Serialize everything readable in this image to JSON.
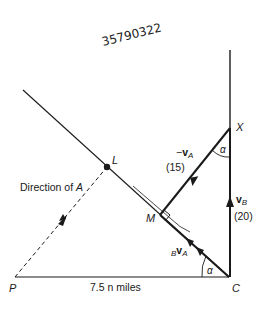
{
  "handwritten_note": "35790322",
  "points": {
    "P": {
      "label": "P"
    },
    "C": {
      "label": "C"
    },
    "X": {
      "label": "X"
    },
    "M": {
      "label": "M"
    },
    "L": {
      "label": "L"
    }
  },
  "labels": {
    "direction_of_a": "Direction of ",
    "direction_of_a_var": "A",
    "distance": "7.5 n miles",
    "neg_va_sign": "−",
    "neg_va_v": "v",
    "neg_va_sub": "A",
    "neg_va_value": "(15)",
    "vb_v": "v",
    "vb_sub": "B",
    "vb_value": "(20)",
    "bva_pre": "B",
    "bva_v": "v",
    "bva_sub": "A",
    "alpha_top": "α",
    "alpha_bottom": "α"
  },
  "colors": {
    "line": "#1a1a1a",
    "background": "#ffffff"
  }
}
